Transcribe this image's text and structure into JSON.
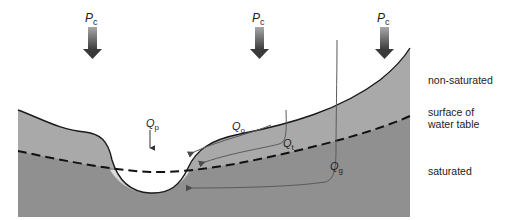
{
  "diagram": {
    "precipitation": [
      {
        "symbol": "P",
        "subscript": "c",
        "x": 92
      },
      {
        "symbol": "P",
        "subscript": "c",
        "x": 259
      },
      {
        "symbol": "P",
        "subscript": "c",
        "x": 384
      }
    ],
    "flows": {
      "channel_precipitation": {
        "symbol": "Q",
        "subscript": "p"
      },
      "overland_flow": {
        "symbol": "Q",
        "subscript": "o"
      },
      "throughflow": {
        "symbol": "Q",
        "subscript": "t"
      },
      "groundwater_flow": {
        "symbol": "Q",
        "subscript": "g"
      }
    },
    "zones": {
      "non_saturated": "non-saturated",
      "water_table_line1": "surface of",
      "water_table_line2": "water table",
      "saturated": "saturated"
    },
    "colors": {
      "unsaturated_fill": "#a9a9a9",
      "saturated_fill": "#8f8f8f",
      "channel_water": "#d6d6d6",
      "outline": "#1a1a1a",
      "flow_line": "#5a5a5a",
      "arrow_top": "#9a9a9a",
      "arrow_bottom": "#3a3a3a"
    }
  }
}
